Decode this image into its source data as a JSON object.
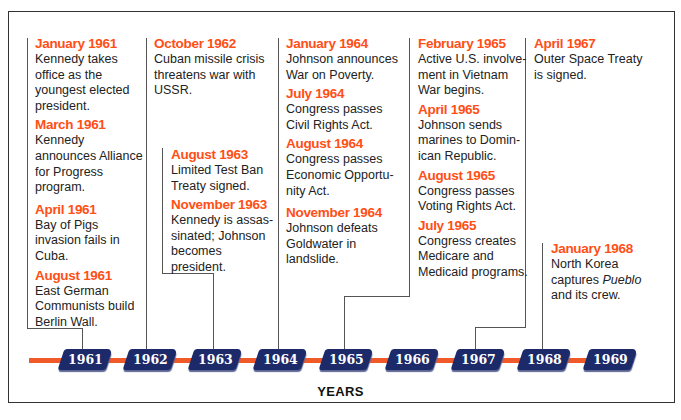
{
  "timeline": {
    "axis_label": "YEARS",
    "years": [
      "1961",
      "1962",
      "1963",
      "1964",
      "1965",
      "1966",
      "1967",
      "1968",
      "1969"
    ],
    "colors": {
      "date": "#ff4f16",
      "rail": "#f05a28",
      "year_tab": "#1c2a6a",
      "text": "#222222"
    }
  },
  "columns": [
    {
      "id": "col-1961",
      "events": [
        {
          "date": "January 1961",
          "desc": "Kennedy takes office as the youngest elected president."
        },
        {
          "date": "March 1961",
          "desc": "Kennedy announces Alliance for Progress program."
        },
        {
          "date": "April 1961",
          "desc": "Bay of Pigs invasion fails in Cuba."
        },
        {
          "date": "August 1961",
          "desc": "East German Communists build Berlin Wall."
        }
      ]
    },
    {
      "id": "col-1962",
      "events": [
        {
          "date": "October 1962",
          "desc": "Cuban missile crisis threatens war with USSR."
        }
      ]
    },
    {
      "id": "col-1963",
      "events": [
        {
          "date": "August 1963",
          "desc": "Limited Test Ban Treaty signed."
        },
        {
          "date": "November 1963",
          "desc": "Kennedy is assas-sinated; Johnson becomes president."
        }
      ]
    },
    {
      "id": "col-1964",
      "events": [
        {
          "date": "January 1964",
          "desc": "Johnson announces War on Poverty."
        },
        {
          "date": "July 1964",
          "desc": "Congress passes Civil Rights Act."
        },
        {
          "date": "August 1964",
          "desc": "Congress passes Economic Opportu-nity Act."
        },
        {
          "date": "November 1964",
          "desc": "Johnson defeats Goldwater in landslide."
        }
      ]
    },
    {
      "id": "col-1965",
      "events": [
        {
          "date": "February 1965",
          "desc": "Active U.S. involve-ment in Vietnam War begins."
        },
        {
          "date": "April 1965",
          "desc": "Johnson sends marines to Domin-ican Republic."
        },
        {
          "date": "August 1965",
          "desc": "Congress passes Voting Rights Act."
        },
        {
          "date": "July 1965",
          "desc": "Congress creates Medicare and Medicaid programs."
        }
      ]
    },
    {
      "id": "col-1967",
      "events": [
        {
          "date": "April 1967",
          "desc": "Outer Space Treaty is signed."
        }
      ]
    },
    {
      "id": "col-1968",
      "events": [
        {
          "date": "January 1968",
          "desc_pre": "North Korea captures ",
          "desc_em": "Pueblo",
          "desc_post": " and its crew."
        }
      ]
    }
  ]
}
